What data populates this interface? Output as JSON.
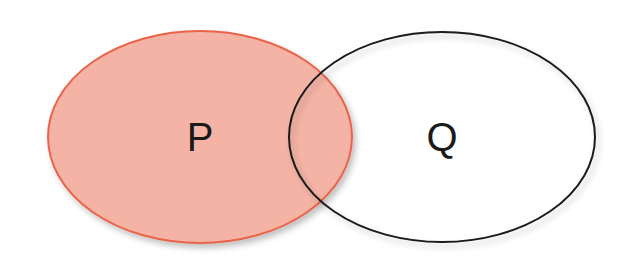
{
  "diagram": {
    "type": "venn",
    "sets": [
      {
        "label": "P",
        "fill": "#f4b3a5",
        "stroke": "#e8644a",
        "cx": 200,
        "cy": 137,
        "rx": 152,
        "ry": 106
      },
      {
        "label": "Q",
        "fill": "none",
        "stroke": "#1a1a1a",
        "cx": 442,
        "cy": 137,
        "rx": 153,
        "ry": 105
      }
    ]
  }
}
